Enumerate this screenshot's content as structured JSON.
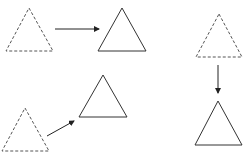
{
  "diagram": {
    "title": "",
    "background": "#ffffff",
    "stroke_color": "#333333",
    "dashed_stroke_color": "#555555",
    "shapes": [
      {
        "id": "tri-a-original",
        "kind": "triangle",
        "style": "dashed",
        "points": [
          [
            29,
            8
          ],
          [
            53,
            51
          ],
          [
            6,
            51
          ]
        ]
      },
      {
        "id": "tri-a-image",
        "kind": "triangle",
        "style": "solid",
        "points": [
          [
            122,
            8
          ],
          [
            146,
            51
          ],
          [
            98,
            51
          ]
        ]
      },
      {
        "id": "tri-b-original",
        "kind": "triangle",
        "style": "dashed",
        "points": [
          [
            219,
            14
          ],
          [
            242,
            57
          ],
          [
            196,
            57
          ]
        ]
      },
      {
        "id": "tri-b-image",
        "kind": "triangle",
        "style": "solid",
        "points": [
          [
            218,
            101
          ],
          [
            242,
            145
          ],
          [
            195,
            145
          ]
        ]
      },
      {
        "id": "tri-c-original",
        "kind": "triangle",
        "style": "dashed",
        "points": [
          [
            25,
            108
          ],
          [
            49,
            151
          ],
          [
            2,
            151
          ]
        ]
      },
      {
        "id": "tri-c-image",
        "kind": "triangle",
        "style": "solid",
        "points": [
          [
            103,
            75
          ],
          [
            127,
            117
          ],
          [
            79,
            117
          ]
        ]
      }
    ],
    "arrows": [
      {
        "id": "arrow-right",
        "direction": "right",
        "from": [
          55,
          29
        ],
        "to": [
          99,
          29
        ]
      },
      {
        "id": "arrow-down",
        "direction": "down",
        "from": [
          218,
          65
        ],
        "to": [
          218,
          93
        ]
      },
      {
        "id": "arrow-up-right",
        "direction": "up-right",
        "from": [
          47,
          136
        ],
        "to": [
          74,
          121
        ]
      }
    ]
  }
}
